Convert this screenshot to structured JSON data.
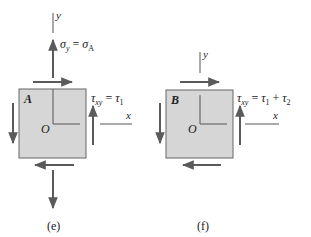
{
  "colors": {
    "element_fill": "#d6d6d6",
    "element_stroke": "#555555",
    "arrow": "#5a5a5a",
    "axis": "#555555",
    "text": "#222222"
  },
  "figure_e": {
    "caption": "(e)",
    "element_label": "A",
    "origin_label": "O",
    "x_axis_label": "x",
    "y_axis_label": "y",
    "normal_stress_label": {
      "sym": "σ",
      "sub": "y",
      "eq": " = ",
      "rhs": "σ",
      "rhs_sub": "A"
    },
    "shear_stress_label": {
      "sym": "τ",
      "sub": "xy",
      "eq": " = ",
      "rhs": "τ",
      "rhs_sub": "1"
    }
  },
  "figure_f": {
    "caption": "(f)",
    "element_label": "B",
    "origin_label": "O",
    "x_axis_label": "x",
    "y_axis_label": "y",
    "shear_stress_label": {
      "sym": "τ",
      "sub": "xy",
      "eq": " = ",
      "rhs": "τ",
      "rhs_sub": "1",
      "plus": " + ",
      "rhs2": "τ",
      "rhs2_sub": "2"
    }
  }
}
